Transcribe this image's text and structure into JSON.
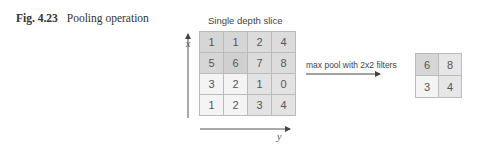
{
  "caption": {
    "label": "Fig. 4.23",
    "text": "Pooling operation"
  },
  "diagram": {
    "slice_title": "Single depth slice",
    "x_axis_label": "x",
    "y_axis_label": "y",
    "operation_label": "max pool with 2x2 filters",
    "input_grid": [
      [
        {
          "v": "1",
          "c": "#d6d6d6"
        },
        {
          "v": "1",
          "c": "#d6d6d6"
        },
        {
          "v": "2",
          "c": "#dcdcdc"
        },
        {
          "v": "4",
          "c": "#dcdcdc"
        }
      ],
      [
        {
          "v": "5",
          "c": "#d6d6d6"
        },
        {
          "v": "6",
          "c": "#d0d0d0"
        },
        {
          "v": "7",
          "c": "#dcdcdc"
        },
        {
          "v": "8",
          "c": "#dcdcdc"
        }
      ],
      [
        {
          "v": "3",
          "c": "#f4f4f4"
        },
        {
          "v": "2",
          "c": "#f4f4f4"
        },
        {
          "v": "1",
          "c": "#e3e3e3"
        },
        {
          "v": "0",
          "c": "#e3e3e3"
        }
      ],
      [
        {
          "v": "1",
          "c": "#f4f4f4"
        },
        {
          "v": "2",
          "c": "#f4f4f4"
        },
        {
          "v": "3",
          "c": "#e3e3e3"
        },
        {
          "v": "4",
          "c": "#e3e3e3"
        }
      ]
    ],
    "output_grid": [
      [
        {
          "v": "6",
          "c": "#d6d6d6"
        },
        {
          "v": "8",
          "c": "#e6e6e6"
        }
      ],
      [
        {
          "v": "3",
          "c": "#f4f4f4"
        },
        {
          "v": "4",
          "c": "#e6e6e6"
        }
      ]
    ]
  }
}
